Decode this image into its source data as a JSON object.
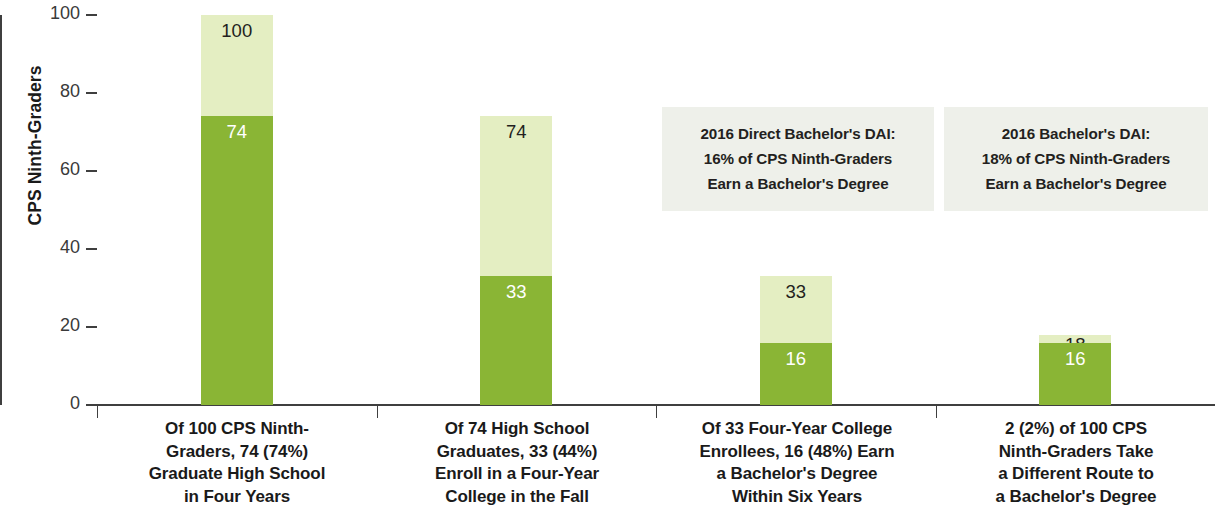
{
  "chart_data": {
    "type": "bar",
    "title": "",
    "subtitle": "",
    "xlabel": "",
    "ylabel": "CPS Ninth-Graders",
    "ylim": [
      0,
      100
    ],
    "yticks": [
      0,
      20,
      40,
      60,
      80,
      100
    ],
    "ytick_labels": [
      "0",
      "20",
      "40",
      "60",
      "80",
      "100"
    ],
    "grid": false,
    "legend": null,
    "stacked": true,
    "colors": {
      "light_green": "#e4eec2",
      "dark_green": "#8ab535",
      "callout_bg": "#eef0ea",
      "axis": "#3f3f3f",
      "text": "#231f20",
      "label_on_dark": "#ffffff"
    },
    "categories": [
      "Of 100 CPS Ninth-Graders, 74 (74%) Graduate High School in Four Years",
      "Of 74 High School Graduates, 33 (44%) Enroll in a Four-Year College in the Fall",
      "Of 33 Four-Year College Enrollees, 16 (48%) Earn a Bachelor's Degree Within Six Years",
      "2 (2%) of 100 CPS Ninth-Graders Take a Different Route to a Bachelor's Degree"
    ],
    "series": [
      {
        "name": "Total (light green)",
        "values": [
          100,
          74,
          33,
          18
        ]
      },
      {
        "name": "Outcome (dark green)",
        "values": [
          74,
          33,
          16,
          16
        ]
      }
    ],
    "bars": [
      {
        "total": 100,
        "filled": 74,
        "total_label": "100",
        "filled_label": "74"
      },
      {
        "total": 74,
        "filled": 33,
        "total_label": "74",
        "filled_label": "33"
      },
      {
        "total": 33,
        "filled": 16,
        "total_label": "33",
        "filled_label": "16"
      },
      {
        "total": 18,
        "filled": 16,
        "total_label": "18",
        "filled_label": "16"
      }
    ],
    "annotations": [
      {
        "lines": [
          "2016 Direct Bachelor's DAI:",
          "16% of CPS Ninth-Graders",
          "Earn a Bachelor's Degree"
        ]
      },
      {
        "lines": [
          "2016 Bachelor's DAI:",
          "18% of CPS Ninth-Graders",
          "Earn a Bachelor's Degree"
        ]
      }
    ]
  },
  "axis": {
    "y_title": "CPS Ninth-Graders",
    "y_tick_0": "0",
    "y_tick_1": "20",
    "y_tick_2": "40",
    "y_tick_3": "60",
    "y_tick_4": "80",
    "y_tick_5": "100"
  },
  "categories": {
    "cat0_line0": "Of 100 CPS Ninth-",
    "cat0_line1": "Graders, 74 (74%)",
    "cat0_line2": "Graduate High School",
    "cat0_line3": "in Four Years",
    "cat1_line0": "Of 74 High School",
    "cat1_line1": "Graduates, 33 (44%)",
    "cat1_line2": "Enroll in a Four-Year",
    "cat1_line3": "College in the Fall",
    "cat2_line0": "Of 33 Four-Year College",
    "cat2_line1": "Enrollees, 16 (48%) Earn",
    "cat2_line2": "a Bachelor's Degree",
    "cat2_line3": "Within Six Years",
    "cat3_line0": "2 (2%) of 100 CPS",
    "cat3_line1": "Ninth-Graders Take",
    "cat3_line2": "a Different Route to",
    "cat3_line3": "a Bachelor's Degree"
  },
  "bar_labels": {
    "bar0_total": "100",
    "bar0_filled": "74",
    "bar1_total": "74",
    "bar1_filled": "33",
    "bar2_total": "33",
    "bar2_filled": "16",
    "bar3_total": "18",
    "bar3_filled": "16"
  },
  "callouts": {
    "a_line0": "2016 Direct Bachelor's DAI:",
    "a_line1": "16% of CPS Ninth-Graders",
    "a_line2": "Earn a Bachelor's Degree",
    "b_line0": "2016 Bachelor's DAI:",
    "b_line1": "18% of CPS Ninth-Graders",
    "b_line2": "Earn a Bachelor's Degree"
  }
}
